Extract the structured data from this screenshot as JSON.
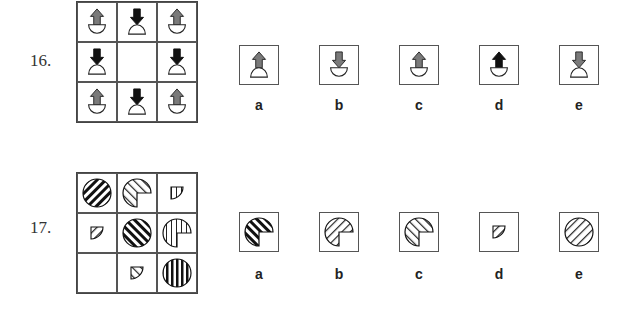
{
  "questions": [
    {
      "number": "16.",
      "grid": [
        [
          "arrow-up-gray-cup",
          "arrow-down-black-dome",
          "arrow-up-gray-cup"
        ],
        [
          "arrow-down-black-dome",
          "empty",
          "arrow-down-black-dome"
        ],
        [
          "arrow-up-gray-cup",
          "arrow-down-black-dome",
          "arrow-up-gray-cup"
        ]
      ],
      "options": [
        {
          "label": "a",
          "figure": "arrow-up-gray-dome"
        },
        {
          "label": "b",
          "figure": "arrow-down-gray-cup"
        },
        {
          "label": "c",
          "figure": "arrow-up-gray-cup"
        },
        {
          "label": "d",
          "figure": "arrow-up-black-cup"
        },
        {
          "label": "e",
          "figure": "arrow-down-gray-dome"
        }
      ]
    },
    {
      "number": "17.",
      "grid": [
        [
          "full-circle-diagonal-thick",
          "three-quarter-circle-diagonal-thin",
          "quarter-circle-vertical"
        ],
        [
          "quarter-circle-diagonal",
          "full-circle-diagonal-backslash-thick",
          "three-quarter-circle-vertical"
        ],
        [
          "empty",
          "quarter-circle-backslash",
          "full-circle-vertical-thick"
        ]
      ],
      "options": [
        {
          "label": "a",
          "figure": "three-quarter-circle-backslash-thick"
        },
        {
          "label": "b",
          "figure": "three-quarter-circle-diagonal-thin"
        },
        {
          "label": "c",
          "figure": "three-quarter-circle-backslash-thin"
        },
        {
          "label": "d",
          "figure": "quarter-circle-diagonal"
        },
        {
          "label": "e",
          "figure": "full-circle-diagonal-thin"
        }
      ]
    }
  ],
  "colors": {
    "gray_arrow": "#7a7a7a",
    "black_arrow": "#111111",
    "border": "#555555"
  }
}
